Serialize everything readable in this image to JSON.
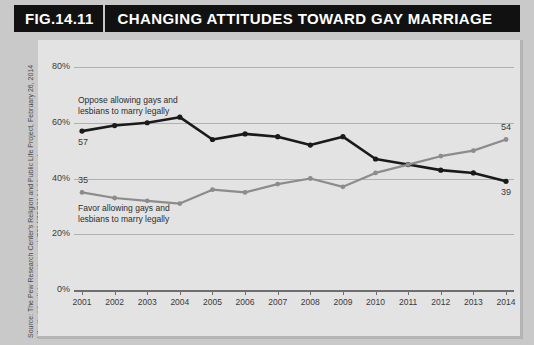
{
  "header": {
    "figure_number": "FIG.14.11",
    "title": "CHANGING ATTITUDES TOWARD GAY MARRIAGE"
  },
  "source": {
    "line1": "Source: The Pew Research Center's Religion and Public Life Project, February 26, 2014",
    "line2": "http://publicreligion.org/research/2014/02/2014-lgbt-survey/"
  },
  "annotations": {
    "oppose_line1": "Oppose allowing gays and",
    "oppose_line2": "lesbians to marry legally",
    "favor_line1": "Favor allowing gays and",
    "favor_line2": "lesbians to marry legally",
    "oppose_start_value": "57",
    "oppose_end_value": "39",
    "favor_start_value": "35",
    "favor_end_value": "54"
  },
  "colors": {
    "oppose": "#1a1a1a",
    "favor": "#8c8c8c",
    "panel_bg": "#e3e3e3",
    "page_bg": "#c9c9c9",
    "header_bg": "#111111",
    "gridline": "#b0b0b0"
  },
  "chart_data": {
    "type": "line",
    "title": "CHANGING ATTITUDES TOWARD GAY MARRIAGE",
    "xlabel": "",
    "ylabel": "",
    "x": [
      2001,
      2002,
      2003,
      2004,
      2005,
      2006,
      2007,
      2008,
      2009,
      2010,
      2011,
      2012,
      2013,
      2014
    ],
    "xtick_labels": [
      "2001",
      "2002",
      "2003",
      "2004",
      "2005",
      "2006",
      "2007",
      "2008",
      "2009",
      "2010",
      "2011",
      "2012",
      "2013",
      "2014"
    ],
    "ytick_labels": [
      "0%",
      "20%",
      "40%",
      "60%",
      "80%"
    ],
    "yticks": [
      0,
      20,
      40,
      60,
      80
    ],
    "ylim": [
      0,
      90
    ],
    "grid": true,
    "legend": "inline-annotations",
    "series": [
      {
        "name": "Oppose allowing gays and lesbians to marry legally",
        "color": "#1a1a1a",
        "values": [
          57,
          59,
          60,
          62,
          54,
          56,
          55,
          52,
          55,
          47,
          45,
          43,
          42,
          39
        ]
      },
      {
        "name": "Favor allowing gays and lesbians to marry legally",
        "color": "#8c8c8c",
        "values": [
          35,
          33,
          32,
          31,
          36,
          35,
          38,
          40,
          37,
          42,
          45,
          48,
          50,
          54
        ]
      }
    ]
  }
}
